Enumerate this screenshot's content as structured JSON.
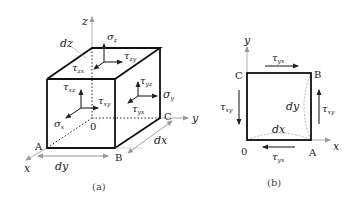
{
  "figure_a": {
    "caption": "(a)",
    "axes": {
      "z": "z",
      "y": "y",
      "x": "x"
    },
    "vertices": {
      "A": "A",
      "B": "B",
      "C": "C",
      "origin": "0"
    },
    "dimensions": {
      "dx": "dx",
      "dy": "dy",
      "dz": "dz"
    },
    "stresses": {
      "sigma_z": {
        "base": "σ",
        "sub": "z"
      },
      "tau_zy": {
        "base": "τ",
        "sub": "zy"
      },
      "tau_zx": {
        "base": "τ",
        "sub": "zx"
      },
      "tau_yz": {
        "base": "τ",
        "sub": "yz"
      },
      "tau_xz": {
        "base": "τ",
        "sub": "xz"
      },
      "sigma_y": {
        "base": "σ",
        "sub": "y"
      },
      "tau_xy": {
        "base": "τ",
        "sub": "xy"
      },
      "tau_yx": {
        "base": "τ",
        "sub": "yx"
      },
      "sigma_x": {
        "base": "σ",
        "sub": "x"
      }
    }
  },
  "figure_b": {
    "caption": "(b)",
    "axes": {
      "y": "y",
      "x": "x"
    },
    "vertices": {
      "A": "A",
      "B": "B",
      "C": "C",
      "origin": "0"
    },
    "dimensions": {
      "dx": "dx",
      "dy": "dy"
    },
    "stresses": {
      "tau_yx_top": {
        "base": "τ",
        "sub": "yx"
      },
      "tau_yx_bottom": {
        "base": "τ",
        "sub": "yx"
      },
      "tau_xy_left": {
        "base": "τ",
        "sub": "xy"
      },
      "tau_xy_right": {
        "base": "τ",
        "sub": "xy"
      }
    }
  }
}
